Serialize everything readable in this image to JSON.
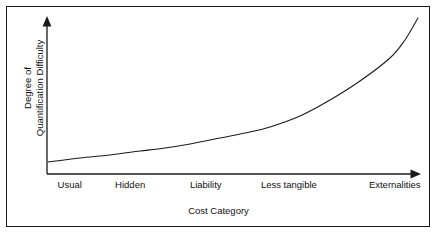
{
  "figure": {
    "background_color": "#ffffff",
    "frame_color": "#1a1a1a",
    "line_color": "#1a1a1a",
    "text_color": "#101010"
  },
  "axes": {
    "y_title_line1": "Degree of",
    "y_title_line2": "Quantification Difficulty",
    "x_title": "Cost Category"
  },
  "ticks": [
    {
      "label": "Usual",
      "x_pct": 6
    },
    {
      "label": "Hidden",
      "x_pct": 22
    },
    {
      "label": "Liability",
      "x_pct": 42
    },
    {
      "label": "Less tangible",
      "x_pct": 64
    },
    {
      "label": "Externalities",
      "x_pct": 92
    }
  ],
  "chart_data": {
    "type": "line",
    "title": "",
    "xlabel": "Cost Category",
    "ylabel": "Degree of Quantification Difficulty",
    "categories": [
      "Usual",
      "Hidden",
      "Liability",
      "Less tangible",
      "Externalities"
    ],
    "x": [
      0,
      1,
      2,
      3,
      4
    ],
    "values": [
      0.08,
      0.16,
      0.29,
      0.52,
      1.0
    ],
    "series": [
      {
        "name": "Quantification difficulty",
        "values": [
          0.08,
          0.16,
          0.29,
          0.52,
          1.0
        ]
      }
    ],
    "curve_points_px": [
      [
        48,
        162
      ],
      [
        80,
        158
      ],
      [
        110,
        155
      ],
      [
        140,
        151
      ],
      [
        158,
        149
      ],
      [
        190,
        144
      ],
      [
        220,
        138
      ],
      [
        250,
        132
      ],
      [
        270,
        127
      ],
      [
        300,
        116
      ],
      [
        330,
        100
      ],
      [
        360,
        81
      ],
      [
        390,
        58
      ],
      [
        405,
        40
      ],
      [
        418,
        18
      ]
    ],
    "xlim": [
      0,
      4
    ],
    "ylim": [
      0,
      1
    ],
    "grid": false,
    "legend": false,
    "axis_arrows": true,
    "axis_tick_marks": false,
    "note": "Monotonically increasing exponential-like curve; quantification difficulty rises sharply for externalities."
  }
}
